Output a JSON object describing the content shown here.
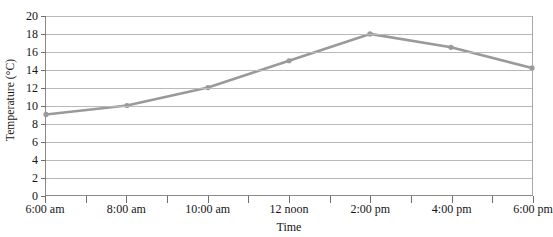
{
  "chart_data": {
    "type": "line",
    "title": "",
    "xlabel": "Time",
    "ylabel": "Temperature (°C)",
    "categories": [
      "6:00 am",
      "8:00 am",
      "10:00 am",
      "12 noon",
      "2:00 pm",
      "4:00 pm",
      "6:00 pm"
    ],
    "values": [
      9,
      10,
      12,
      15,
      18,
      16.5,
      14.2
    ],
    "series": [
      {
        "name": "Temperature",
        "values": [
          9,
          10,
          12,
          15,
          18,
          16.5,
          14.2
        ]
      }
    ],
    "ylim": [
      0,
      20
    ],
    "ytick_labels": [
      "0",
      "2",
      "4",
      "6",
      "8",
      "10",
      "12",
      "14",
      "16",
      "18",
      "20"
    ],
    "ytick_values": [
      0,
      2,
      4,
      6,
      8,
      10,
      12,
      14,
      16,
      18,
      20
    ],
    "grid": "horizontal",
    "legend": "none",
    "x_minor_ticks": true,
    "x_tick_count": 13,
    "line_color": "#9a9a9a",
    "marker_color": "#9a9a9a",
    "grid_color": "#b9b9b9",
    "axis_color": "#8a8a8a",
    "text_color": "#141414",
    "background": "#ffffff"
  }
}
